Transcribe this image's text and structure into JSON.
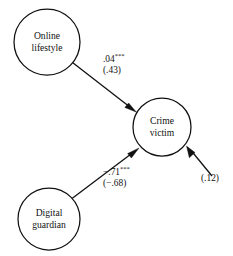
{
  "figure": {
    "type": "path-diagram",
    "background_color": "#ffffff",
    "stroke_color": "#111111"
  },
  "nodes": {
    "online_lifestyle": {
      "line1": "Online",
      "line2": "lifestyle",
      "cx": 47,
      "cy": 42,
      "r": 33
    },
    "crime_victim": {
      "line1": "Crime",
      "line2": "victim",
      "cx": 162,
      "cy": 127,
      "r": 29
    },
    "digital_guardian": {
      "line1": "Digital",
      "line2": "guardian",
      "cx": 49,
      "cy": 219,
      "r": 31
    }
  },
  "paths": {
    "lifestyle_to_victim": {
      "coefficient": ".04",
      "significance": "***",
      "standardized": "(.43)"
    },
    "guardian_to_victim": {
      "coefficient": "−.71",
      "significance": "***",
      "standardized": "(−.68)"
    },
    "disturbance": {
      "value": "(.12)"
    }
  }
}
